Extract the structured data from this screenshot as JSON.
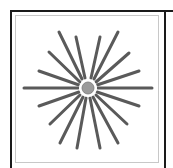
{
  "figure": {
    "label": "radial-burst-icon",
    "colors": {
      "frame_dark": "#1a1a1a",
      "frame_light": "#c8c8c8",
      "spoke": "#5a5a5a",
      "hub_fill": "#9a9a9a",
      "hub_ring": "#ffffff"
    },
    "center": [
      88,
      88
    ],
    "hub_radius": 6,
    "spokes": [
      [
        24,
        88,
        78,
        88
      ],
      [
        98,
        88,
        152,
        88
      ],
      [
        59,
        32,
        82,
        79
      ],
      [
        76,
        37,
        85,
        78
      ],
      [
        100,
        37,
        91,
        78
      ],
      [
        118,
        32,
        94,
        79
      ],
      [
        49,
        52,
        80,
        82
      ],
      [
        129,
        53,
        96,
        82
      ],
      [
        39,
        71,
        79,
        85
      ],
      [
        139,
        71,
        97,
        85
      ],
      [
        39,
        106,
        79,
        92
      ],
      [
        139,
        106,
        97,
        92
      ],
      [
        50,
        124,
        80,
        95
      ],
      [
        127,
        124,
        96,
        95
      ],
      [
        60,
        143,
        83,
        97
      ],
      [
        77,
        148,
        86,
        98
      ],
      [
        100,
        148,
        90,
        98
      ],
      [
        118,
        143,
        93,
        97
      ]
    ]
  }
}
